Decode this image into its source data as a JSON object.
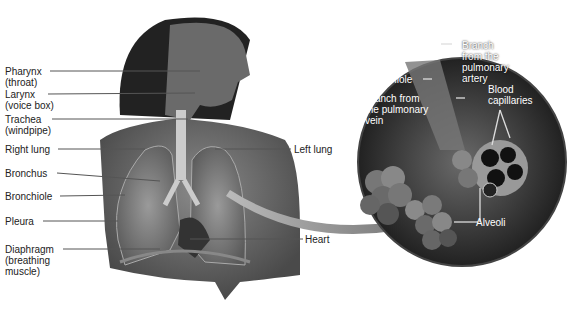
{
  "left_labels": [
    {
      "id": "pharynx",
      "text": "Pharynx\n(throat)"
    },
    {
      "id": "larynx",
      "text": "Larynx\n(voice box)"
    },
    {
      "id": "trachea",
      "text": "Trachea\n(windpipe)"
    },
    {
      "id": "right_lung",
      "text": "Right lung"
    },
    {
      "id": "bronchus",
      "text": "Bronchus"
    },
    {
      "id": "bronchiole",
      "text": "Bronchiole"
    },
    {
      "id": "pleura",
      "text": "Pleura"
    },
    {
      "id": "diaphragm",
      "text": "Diaphragm\n(breathing\nmuscle)"
    }
  ],
  "right_labels": [
    {
      "id": "left_lung",
      "text": "Left lung"
    },
    {
      "id": "heart",
      "text": "Heart"
    }
  ],
  "inset_labels": [
    {
      "id": "artery",
      "text": "Branch\nfrom the\npulmonary\nartery"
    },
    {
      "id": "inset_bronchiole",
      "text": "Bronchiole"
    },
    {
      "id": "vein",
      "text": "Branch from\nthe pulmonary\nvein"
    },
    {
      "id": "capillaries",
      "text": "Blood\ncapillaries"
    },
    {
      "id": "alveoli",
      "text": "Alveoli"
    }
  ]
}
